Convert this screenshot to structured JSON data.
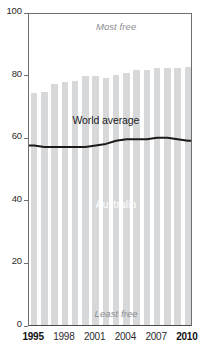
{
  "chart_data": {
    "type": "bar",
    "title": "",
    "xlabel": "",
    "ylabel": "",
    "ylim": [
      0,
      100
    ],
    "xlim": [
      1995,
      2010
    ],
    "grid": false,
    "legend_position": "inline-annotations",
    "y_ticks": [
      0,
      20,
      40,
      60,
      80,
      100
    ],
    "y_tick_labels": [
      "0",
      "20",
      "40",
      "60",
      "80",
      "100"
    ],
    "x_ticks": [
      1995,
      1998,
      2001,
      2004,
      2007,
      2010
    ],
    "x_tick_labels": [
      "1995",
      "1998",
      "2001",
      "2004",
      "2007",
      "2010"
    ],
    "categories": [
      1995,
      1996,
      1997,
      1998,
      1999,
      2000,
      2001,
      2002,
      2003,
      2004,
      2005,
      2006,
      2007,
      2008,
      2009,
      2010
    ],
    "series": [
      {
        "name": "Australia",
        "render": "bar",
        "color": "#d6d8da",
        "values": [
          74,
          74.5,
          77,
          77.5,
          78,
          79.5,
          79.5,
          79,
          80,
          80.5,
          81.5,
          81.5,
          82,
          82,
          82,
          82.5
        ]
      },
      {
        "name": "World average",
        "render": "line",
        "color": "#1b1b1b",
        "values": [
          58,
          57.5,
          57.5,
          57.5,
          57.5,
          57.5,
          58,
          58.5,
          59.5,
          60,
          60,
          60,
          60.5,
          60.5,
          60,
          59.5
        ]
      }
    ],
    "annotations": [
      {
        "id": "most-free",
        "text": "Most free",
        "x": 2002.5,
        "y": 96,
        "style": "italic-gray"
      },
      {
        "id": "least-free",
        "text": "Least free",
        "x": 2002.5,
        "y": 4,
        "style": "italic-gray"
      },
      {
        "id": "series-label-world",
        "text": "World average",
        "x": 2001.5,
        "y": 66,
        "style": "plain-dark"
      },
      {
        "id": "series-label-country",
        "text": "Australia",
        "x": 2002.5,
        "y": 39,
        "style": "plain-white"
      }
    ]
  },
  "labels": {
    "most_free": "Most free",
    "least_free": "Least free",
    "world_average": "World average",
    "australia": "Australia"
  },
  "colors": {
    "bar": "#d6d8da",
    "line": "#1b1b1b",
    "axis": "#6e6e6e",
    "annotation_gray": "#8a8c8f",
    "background": "#ffffff"
  }
}
